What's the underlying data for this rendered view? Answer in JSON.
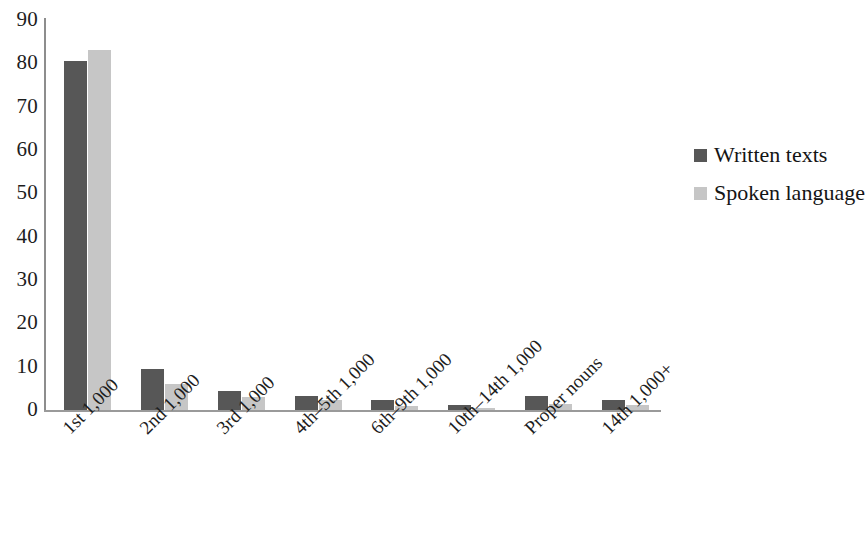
{
  "chart_data": {
    "type": "bar",
    "title": "",
    "subtitle": "",
    "xlabel": "",
    "ylabel": "",
    "ylim": [
      0,
      90
    ],
    "ytick_step": 10,
    "yticks": [
      "90",
      "80",
      "70",
      "60",
      "50",
      "40",
      "30",
      "20",
      "10",
      "0"
    ],
    "grid": false,
    "legend_position": "right",
    "categories": [
      "1st 1,000",
      "2nd 1,000",
      "3rd 1,000",
      "4th–5th 1,000",
      "6th–9th 1,000",
      "10th–14th 1,000",
      "Proper nouns",
      "14th 1,000+"
    ],
    "series": [
      {
        "name": "Written texts",
        "color": "#575757",
        "values": [
          80.5,
          9.5,
          4.5,
          3.3,
          2.3,
          1.2,
          3.2,
          2.2
        ]
      },
      {
        "name": "Spoken language",
        "color": "#c6c6c6",
        "values": [
          83.0,
          6.1,
          3.1,
          2.3,
          0.9,
          0.5,
          1.5,
          1.1
        ]
      }
    ]
  },
  "legend": {
    "items": [
      {
        "label": "Written texts",
        "swatch": "written"
      },
      {
        "label": "Spoken language",
        "swatch": "spoken"
      }
    ]
  },
  "axis": {
    "y_max_label": "90",
    "y_min_label": "0"
  }
}
